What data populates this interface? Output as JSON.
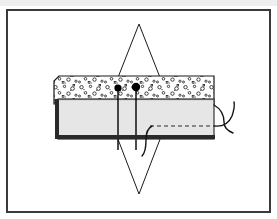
{
  "figure": {
    "title": "Technical cross-section diagram",
    "canvas": {
      "width": 277,
      "height": 219,
      "background": "#ffffff"
    },
    "top_strip": {
      "name": "page-margin-strip",
      "color": "#efefef",
      "height": 6
    }
  },
  "frame": {
    "label": "figure-border",
    "x": 7,
    "y": 10,
    "width": 263,
    "height": 202,
    "stroke": "#3a3a3a",
    "stroke_width": 2,
    "fill": "#ffffff"
  },
  "colors": {
    "outline": "#1a1a1a",
    "frame": "#3a3a3a",
    "aggregate_fill": "#ffffff",
    "aggregate_speck": "#2b2b2b",
    "panel_fill": "#e6e6e6",
    "panel_edge": "#333333",
    "panel_dark_border": "#2a2a2a",
    "pin_head": "#000000",
    "wire": "#141414",
    "dashed": "#2a2a2a",
    "page_strip": "#efefef"
  },
  "diamond": {
    "name": "diamond-reference-outline",
    "top_apex": {
      "x": 139,
      "y": 24
    },
    "right_vertex": {
      "x": 172,
      "y": 108
    },
    "bottom_apex": {
      "x": 139,
      "y": 194
    },
    "left_vertex": {
      "x": 106,
      "y": 108
    },
    "stroke": "#1a1a1a",
    "stroke_width": 1,
    "fill": "none"
  },
  "aggregate_layer": {
    "name": "aggregate-slab-layer",
    "x": 54,
    "y": 76,
    "width": 160,
    "height": 28,
    "fill": "#ffffff",
    "stroke": "#1a1a1a",
    "stroke_width": 1.2,
    "notch": {
      "x": 54,
      "y": 76,
      "corner_cut": 5
    },
    "speck_count": 96,
    "speck_style": "small open circles and dots representing coarse aggregate"
  },
  "panel": {
    "name": "formwork-panel",
    "x": 58,
    "y": 99,
    "width": 156,
    "height": 40,
    "fill": "#e6e6e6",
    "stroke": "#333333",
    "stroke_width": 1.2,
    "left_border": {
      "name": "panel-left-dark-border",
      "width": 4,
      "fill": "#2a2a2a"
    },
    "bottom_border": {
      "name": "panel-bottom-dark-border",
      "height": 4,
      "fill": "#2a2a2a"
    }
  },
  "dashed_line": {
    "name": "embedded-dashed-conductor",
    "x1": 150,
    "y1": 126,
    "x2": 211,
    "y2": 126,
    "stroke": "#2a2a2a",
    "stroke_width": 1.2,
    "dash_pattern": "4 3"
  },
  "pins": [
    {
      "name": "anchor-pin-left",
      "head_cx": 118,
      "head_cy": 88,
      "head_r": 3.6,
      "stem_x": 118,
      "stem_top": 88,
      "stem_bottom": 150,
      "fill": "#000000",
      "stroke_width": 1.4
    },
    {
      "name": "anchor-pin-right",
      "head_cx": 136,
      "head_cy": 87,
      "head_r": 4.2,
      "stem_x": 136,
      "stem_top": 87,
      "stem_bottom": 150,
      "fill": "#000000",
      "stroke_width": 1.4
    }
  ],
  "wires": [
    {
      "name": "lead-wire-upper-right",
      "path": "M 214 105 C 221 109 224 115 224 122 C 224 128 228 131 233 133",
      "stroke": "#141414",
      "stroke_width": 1.4
    },
    {
      "name": "lead-wire-lower-right",
      "path": "M 214 126 C 223 127 229 123 232 116 C 234 110 235 106 234 102",
      "stroke": "#141414",
      "stroke_width": 1.4
    },
    {
      "name": "lead-wire-bottom-center",
      "path": "M 152 126 C 148 128 146 133 146 140 C 146 148 145 153 142 156",
      "stroke": "#141414",
      "stroke_width": 1.4
    }
  ],
  "legend": {
    "aggregate_label": "",
    "panel_label": "",
    "note": ""
  }
}
